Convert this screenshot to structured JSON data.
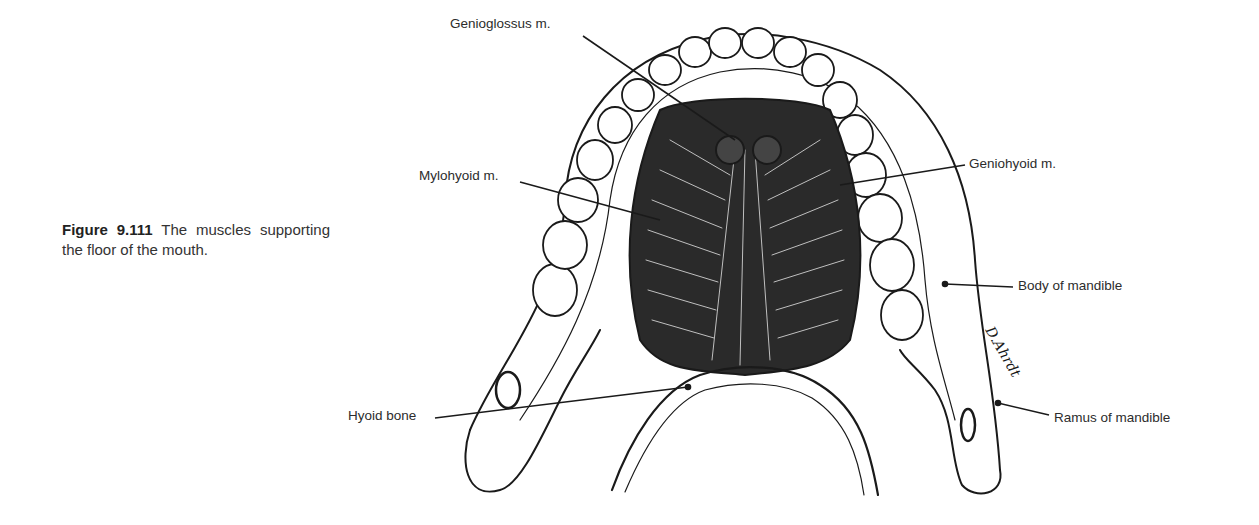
{
  "figure": {
    "number": "Figure 9.111",
    "caption": "The muscles supporting the floor of the mouth.",
    "signature": "D. Ahrdt"
  },
  "labels": {
    "genioglossus": "Genioglossus m.",
    "mylohyoid": "Mylohyoid m.",
    "geniohyoid": "Geniohyoid m.",
    "body_of_mandible": "Body of mandible",
    "ramus_of_mandible": "Ramus of mandible",
    "hyoid_bone": "Hyoid bone"
  },
  "colors": {
    "ink": "#1a1a1a",
    "text": "#2c2c2c",
    "background": "#ffffff"
  }
}
